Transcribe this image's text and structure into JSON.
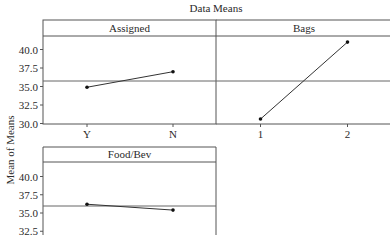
{
  "chart_data": {
    "type": "line",
    "title": "Data Means",
    "ylabel": "Mean of Means",
    "ylim": [
      30.0,
      42.0
    ],
    "yticks": [
      "40.0",
      "37.5",
      "35.0",
      "32.5",
      "30.0"
    ],
    "reference_line": 35.8,
    "panels": [
      {
        "name": "Assigned",
        "categories": [
          "Y",
          "N"
        ],
        "values": [
          34.9,
          37.0
        ]
      },
      {
        "name": "Bags",
        "categories": [
          "1",
          "2"
        ],
        "values": [
          30.6,
          41.0
        ]
      },
      {
        "name": "Food/Bev",
        "categories": [
          "Y",
          "N"
        ],
        "values": [
          36.2,
          35.4
        ]
      }
    ]
  }
}
